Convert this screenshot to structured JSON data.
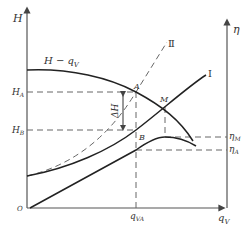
{
  "diagram": {
    "type": "pump operating characteristic diagram",
    "axes": {
      "left_y": {
        "label": "H"
      },
      "right_y": {
        "label": "η"
      },
      "x": {
        "label": "q",
        "label_sub": "V"
      },
      "origin": "O"
    },
    "curves": {
      "pump_head": {
        "label": "H − q",
        "label_sub": "V"
      },
      "system_1": {
        "label": "Ⅰ"
      },
      "system_2": {
        "label": "Ⅱ"
      }
    },
    "points": {
      "A": "A",
      "B": "B",
      "M": "M"
    },
    "left_ticks": {
      "HA": {
        "main": "H",
        "sub": "A"
      },
      "HB": {
        "main": "H",
        "sub": "B"
      }
    },
    "right_ticks": {
      "etaM": {
        "main": "η",
        "sub": "M"
      },
      "etaA": {
        "main": "η",
        "sub": "A"
      }
    },
    "x_ticks": {
      "qVA": {
        "main": "q",
        "sub": "VA"
      }
    },
    "delta": {
      "label": "ΔH"
    }
  }
}
